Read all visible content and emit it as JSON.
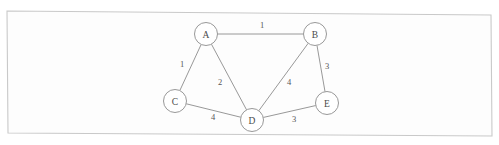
{
  "document": {
    "title": "Weighted Undirected Graph Diagram",
    "background_color": "#ffffff",
    "frame_color": "#c9c9c9",
    "ink_color": "#8c8c8c",
    "label_color": "#4a4a4a"
  },
  "frame": {
    "name": "scanned-page-border",
    "points": "7,11 491,15 492,136 8,133"
  },
  "chart_data": {
    "type": "diagram",
    "subtype": "weighted-undirected-graph",
    "directed": false,
    "weighted": true,
    "nodes": [
      {
        "id": "A",
        "label": "A",
        "x": 206,
        "y": 34,
        "r": 11.5
      },
      {
        "id": "B",
        "label": "B",
        "x": 315,
        "y": 34,
        "r": 11.5
      },
      {
        "id": "C",
        "label": "C",
        "x": 175,
        "y": 101,
        "r": 11.5
      },
      {
        "id": "D",
        "label": "D",
        "x": 252,
        "y": 120,
        "r": 11.5
      },
      {
        "id": "E",
        "label": "E",
        "x": 327,
        "y": 103,
        "r": 11.5
      }
    ],
    "edges": [
      {
        "id": "A-B",
        "source": "A",
        "target": "B",
        "weight": 1,
        "label": "1",
        "label_x": 262,
        "label_y": 25
      },
      {
        "id": "A-C",
        "source": "A",
        "target": "C",
        "weight": 1,
        "label": "1",
        "label_x": 182,
        "label_y": 64
      },
      {
        "id": "A-D",
        "source": "A",
        "target": "D",
        "weight": 2,
        "label": "2",
        "label_x": 220,
        "label_y": 82
      },
      {
        "id": "B-D",
        "source": "B",
        "target": "D",
        "weight": 4,
        "label": "4",
        "label_x": 289,
        "label_y": 82
      },
      {
        "id": "B-E",
        "source": "B",
        "target": "E",
        "weight": 3,
        "label": "3",
        "label_x": 327,
        "label_y": 66
      },
      {
        "id": "C-D",
        "source": "C",
        "target": "D",
        "weight": 4,
        "label": "4",
        "label_x": 213,
        "label_y": 117
      },
      {
        "id": "D-E",
        "source": "D",
        "target": "E",
        "weight": 3,
        "label": "3",
        "label_x": 294,
        "label_y": 119
      }
    ],
    "node_count": 5,
    "edge_count": 7,
    "total_weight": 18
  }
}
